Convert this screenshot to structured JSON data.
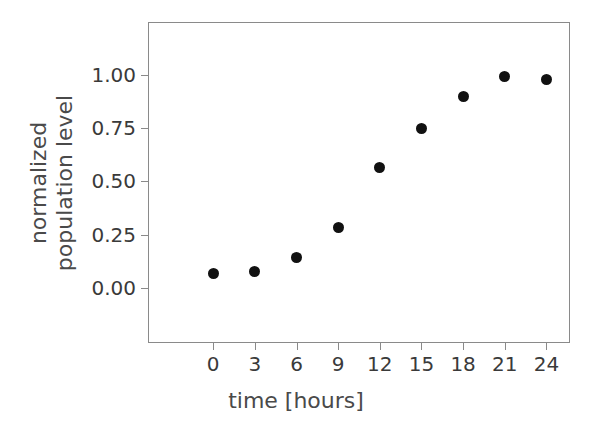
{
  "chart_data": {
    "type": "scatter",
    "title": "",
    "xlabel": "time [hours]",
    "ylabel_lines": [
      "normalized",
      "population level"
    ],
    "ylabel": "normalized population level",
    "x": [
      0,
      3,
      6,
      9,
      12,
      15,
      18,
      21,
      24
    ],
    "values": [
      0.065,
      0.078,
      0.14,
      0.285,
      0.565,
      0.75,
      0.9,
      0.995,
      0.98
    ],
    "series": [
      {
        "name": "normalized population level",
        "values": [
          0.065,
          0.078,
          0.14,
          0.285,
          0.565,
          0.75,
          0.9,
          0.995,
          0.98
        ]
      }
    ],
    "xticks": [
      0,
      3,
      6,
      9,
      12,
      15,
      18,
      21,
      24
    ],
    "xtick_labels": [
      "0",
      "3",
      "6",
      "9",
      "12",
      "15",
      "18",
      "21",
      "24"
    ],
    "yticks": [
      0.0,
      0.25,
      0.5,
      0.75,
      1.0
    ],
    "ytick_labels": [
      "0.00",
      "0.25",
      "0.50",
      "0.75",
      "1.00"
    ],
    "xlim": [
      -4.7,
      25.7
    ],
    "ylim": [
      -0.26,
      1.25
    ],
    "grid": false,
    "legend": "none",
    "marker": "circle",
    "marker_color": "#111111",
    "axis_color": "#8a8a8a",
    "text_color": "#3a3a3a",
    "background": "#ffffff"
  }
}
